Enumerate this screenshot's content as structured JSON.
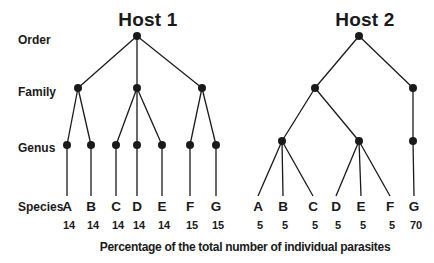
{
  "diagram": {
    "background_color": "#ffffff",
    "ink_color": "#1a1a1a",
    "level_labels": [
      "Order",
      "Family",
      "Genus",
      "Species"
    ],
    "caption": "Percentage of the total number of individual parasites",
    "hosts": [
      {
        "title": "Host 1",
        "species": [
          {
            "label": "A",
            "value": 14
          },
          {
            "label": "B",
            "value": 14
          },
          {
            "label": "C",
            "value": 14
          },
          {
            "label": "D",
            "value": 14
          },
          {
            "label": "E",
            "value": 14
          },
          {
            "label": "F",
            "value": 15
          },
          {
            "label": "G",
            "value": 15
          }
        ],
        "genera_species": [
          [
            0
          ],
          [
            1
          ],
          [
            2
          ],
          [
            3
          ],
          [
            4
          ],
          [
            5
          ],
          [
            6
          ]
        ],
        "families_genera": [
          [
            0,
            1
          ],
          [
            2,
            3,
            4
          ],
          [
            5,
            6
          ]
        ]
      },
      {
        "title": "Host 2",
        "species": [
          {
            "label": "A",
            "value": 5
          },
          {
            "label": "B",
            "value": 5
          },
          {
            "label": "C",
            "value": 5
          },
          {
            "label": "D",
            "value": 5
          },
          {
            "label": "E",
            "value": 5
          },
          {
            "label": "F",
            "value": 5
          },
          {
            "label": "G",
            "value": 70
          }
        ],
        "genera_species": [
          [
            0,
            1,
            2
          ],
          [
            3,
            4,
            5
          ],
          [
            6
          ]
        ],
        "families_genera": [
          [
            0,
            1
          ],
          [
            2
          ]
        ]
      }
    ]
  }
}
